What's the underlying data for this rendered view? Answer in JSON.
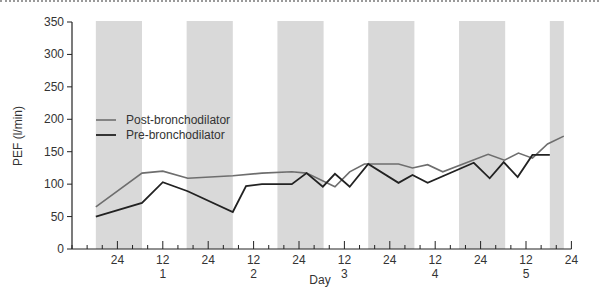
{
  "chart_data": {
    "type": "line",
    "title": "",
    "xlabel": "Day",
    "ylabel": "PEF (l/min)",
    "ylim": [
      0,
      350
    ],
    "yticks": [
      0,
      50,
      100,
      150,
      200,
      250,
      300,
      350
    ],
    "xlim_hours": [
      0,
      132
    ],
    "xticks": [
      {
        "hour": 12,
        "label": "24",
        "day": ""
      },
      {
        "hour": 24,
        "label": "12",
        "day": "1"
      },
      {
        "hour": 36,
        "label": "24",
        "day": ""
      },
      {
        "hour": 48,
        "label": "12",
        "day": "2"
      },
      {
        "hour": 60,
        "label": "24",
        "day": ""
      },
      {
        "hour": 72,
        "label": "12",
        "day": "3"
      },
      {
        "hour": 84,
        "label": "24",
        "day": ""
      },
      {
        "hour": 96,
        "label": "12",
        "day": "4"
      },
      {
        "hour": 108,
        "label": "24",
        "day": ""
      },
      {
        "hour": 120,
        "label": "12",
        "day": "5"
      },
      {
        "hour": 132,
        "label": "24",
        "day": ""
      }
    ],
    "shaded_night_bands_hours": [
      [
        6.3,
        18.5
      ],
      [
        30.3,
        42.5
      ],
      [
        54.3,
        66.5
      ],
      [
        78.3,
        90.5
      ],
      [
        102.3,
        114.5
      ],
      [
        126.3,
        130
      ]
    ],
    "legend": {
      "position": "upper-left",
      "entries": [
        "Post-bronchodilator",
        "Pre-bronchodilator"
      ]
    },
    "grid": false,
    "series": [
      {
        "name": "Post-bronchodilator",
        "color": "#6e6e6e",
        "points": [
          [
            6.3,
            65
          ],
          [
            18.5,
            117
          ],
          [
            24,
            120
          ],
          [
            30.6,
            109
          ],
          [
            42.5,
            113
          ],
          [
            50.2,
            117
          ],
          [
            58.1,
            119
          ],
          [
            62,
            117
          ],
          [
            69.5,
            96
          ],
          [
            73.4,
            119
          ],
          [
            77.3,
            131
          ],
          [
            82,
            131
          ],
          [
            86.3,
            131
          ],
          [
            90,
            125
          ],
          [
            94,
            130
          ],
          [
            98,
            119
          ],
          [
            110,
            146
          ],
          [
            114.3,
            137
          ],
          [
            118,
            148
          ],
          [
            121.7,
            140
          ],
          [
            125.7,
            162
          ],
          [
            130,
            174
          ]
        ]
      },
      {
        "name": "Pre-bronchodilator",
        "color": "#222222",
        "points": [
          [
            6.3,
            50
          ],
          [
            18.5,
            71
          ],
          [
            24,
            103
          ],
          [
            30.6,
            89
          ],
          [
            42.5,
            57
          ],
          [
            46,
            97
          ],
          [
            50.2,
            100
          ],
          [
            58.1,
            100
          ],
          [
            62,
            117
          ],
          [
            66.3,
            96
          ],
          [
            69.5,
            116
          ],
          [
            73.4,
            96
          ],
          [
            78.3,
            131
          ],
          [
            86.3,
            102
          ],
          [
            90,
            114
          ],
          [
            94,
            102
          ],
          [
            106.2,
            133
          ],
          [
            110.4,
            109
          ],
          [
            114.1,
            134
          ],
          [
            117.8,
            111
          ],
          [
            121.7,
            145
          ],
          [
            126.3,
            145
          ]
        ]
      }
    ]
  }
}
